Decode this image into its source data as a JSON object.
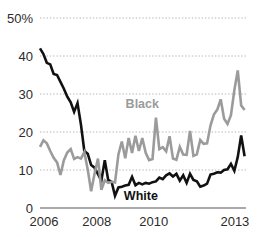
{
  "chart_data": {
    "type": "line",
    "title": "",
    "xlabel": "",
    "ylabel": "",
    "ylim": [
      0,
      50
    ],
    "xlim": [
      2006,
      2013.25
    ],
    "grid": true,
    "legend_position": "inline-annotation",
    "y_ticks": [
      0,
      10,
      20,
      30,
      40,
      50
    ],
    "y_tick_labels": [
      "0",
      "10",
      "20",
      "30",
      "40",
      "50%"
    ],
    "x_ticks": [
      2006,
      2008,
      2010,
      2013
    ],
    "x_tick_labels": [
      "2006",
      "2008",
      "2010",
      "2013"
    ],
    "series": [
      {
        "name": "White",
        "color": "#111111",
        "annotation_label": "White",
        "annotation_x": 2009.55,
        "annotation_y": 2.1,
        "stroke_width": 2.6,
        "x": [
          2006.0,
          2006.12,
          2006.24,
          2006.36,
          2006.48,
          2006.6,
          2006.72,
          2006.84,
          2006.96,
          2007.08,
          2007.2,
          2007.32,
          2007.44,
          2007.56,
          2007.68,
          2007.8,
          2007.92,
          2008.04,
          2008.16,
          2008.28,
          2008.4,
          2008.52,
          2008.64,
          2008.76,
          2008.88,
          2009.0,
          2009.12,
          2009.24,
          2009.36,
          2009.48,
          2009.6,
          2009.72,
          2009.84,
          2009.96,
          2010.08,
          2010.2,
          2010.32,
          2010.44,
          2010.56,
          2010.68,
          2010.8,
          2010.92,
          2011.04,
          2011.16,
          2011.28,
          2011.4,
          2011.52,
          2011.64,
          2011.76,
          2011.88,
          2012.0,
          2012.12,
          2012.24,
          2012.36,
          2012.48,
          2012.6,
          2012.72,
          2012.84,
          2012.96,
          2013.08,
          2013.2
        ],
        "values": [
          42.0,
          40.5,
          38.2,
          37.8,
          35.3,
          35.0,
          33.2,
          31.4,
          29.3,
          27.8,
          25.3,
          27.6,
          22.0,
          15.0,
          14.3,
          11.3,
          10.6,
          8.9,
          7.2,
          12.6,
          7.4,
          6.9,
          3.2,
          5.4,
          5.6,
          5.9,
          6.1,
          8.2,
          6.0,
          6.6,
          6.2,
          6.6,
          6.4,
          6.8,
          7.0,
          8.0,
          7.6,
          8.6,
          9.1,
          8.3,
          9.0,
          7.2,
          8.6,
          6.6,
          9.0,
          7.4,
          7.0,
          5.6,
          5.9,
          6.4,
          8.8,
          9.0,
          9.4,
          9.3,
          10.0,
          10.2,
          11.6,
          9.8,
          13.4,
          19.1,
          13.6
        ]
      },
      {
        "name": "Black",
        "color": "#9b9b9b",
        "annotation_label": "Black",
        "annotation_x": 2009.6,
        "annotation_y": 26.3,
        "stroke_width": 2.6,
        "x": [
          2006.0,
          2006.12,
          2006.24,
          2006.36,
          2006.48,
          2006.6,
          2006.72,
          2006.84,
          2006.96,
          2007.08,
          2007.2,
          2007.32,
          2007.44,
          2007.56,
          2007.68,
          2007.8,
          2007.92,
          2008.04,
          2008.16,
          2008.28,
          2008.4,
          2008.52,
          2008.64,
          2008.76,
          2008.88,
          2009.0,
          2009.12,
          2009.24,
          2009.36,
          2009.48,
          2009.6,
          2009.72,
          2009.84,
          2009.96,
          2010.08,
          2010.2,
          2010.32,
          2010.44,
          2010.56,
          2010.68,
          2010.8,
          2010.92,
          2011.04,
          2011.16,
          2011.28,
          2011.4,
          2011.52,
          2011.64,
          2011.76,
          2011.88,
          2012.0,
          2012.12,
          2012.24,
          2012.36,
          2012.48,
          2012.6,
          2012.72,
          2012.84,
          2012.96,
          2013.08,
          2013.2
        ],
        "values": [
          16.1,
          17.8,
          17.0,
          15.0,
          13.2,
          12.0,
          8.7,
          12.6,
          14.6,
          15.5,
          12.9,
          13.4,
          13.0,
          14.7,
          10.1,
          4.4,
          9.0,
          13.0,
          4.8,
          7.3,
          6.6,
          6.9,
          6.7,
          14.1,
          17.5,
          13.1,
          18.4,
          14.5,
          19.0,
          15.0,
          18.4,
          14.5,
          12.6,
          12.9,
          23.8,
          15.5,
          16.0,
          14.9,
          18.9,
          13.0,
          12.7,
          16.1,
          14.1,
          14.0,
          20.3,
          13.7,
          14.1,
          17.9,
          16.9,
          17.0,
          21.7,
          24.6,
          25.9,
          28.6,
          23.5,
          22.1,
          24.4,
          31.0,
          36.2,
          27.0,
          25.8
        ]
      }
    ]
  }
}
